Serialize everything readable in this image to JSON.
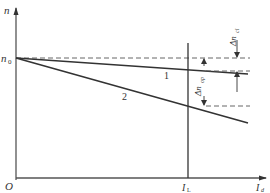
{
  "diagram": {
    "type": "speed-current characteristic",
    "axes": {
      "y_label": "n",
      "x_label_main": "I",
      "x_label_sub": "d",
      "origin_label": "O"
    },
    "y_marks": {
      "n0_main": "n",
      "n0_sub": "0"
    },
    "x_marks": {
      "IL_main": "I",
      "IL_sub": "L"
    },
    "curves": [
      {
        "id": "1",
        "label": "1",
        "description": "closed-loop characteristic (small slope)"
      },
      {
        "id": "2",
        "label": "2",
        "description": "open-loop characteristic (large slope)"
      }
    ],
    "annotations": {
      "delta_n_cl_prefix": "Δn",
      "delta_n_cl_sub": "cl",
      "delta_n_op_prefix": "Δn",
      "delta_n_op_sub": "op"
    },
    "colors": {
      "line": "#333333",
      "axis": "#555555",
      "dashed": "#555555",
      "background": "#ffffff"
    }
  }
}
